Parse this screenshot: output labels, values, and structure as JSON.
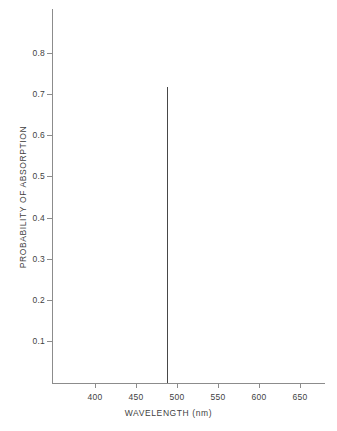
{
  "chart_data": {
    "type": "bar",
    "title": "",
    "subtitle": "",
    "xlabel": "WAVELENGTH (nm)",
    "ylabel": "PROBABILITY OF ABSORPTION",
    "xlim": [
      360,
      690
    ],
    "ylim": [
      0,
      0.93
    ],
    "grid": false,
    "legend": null,
    "x_ticks": [
      400,
      450,
      500,
      550,
      600,
      650
    ],
    "x_tick_labels": [
      "400",
      "450",
      "500",
      "550",
      "600",
      "650"
    ],
    "y_ticks": [
      0.1,
      0.2,
      0.3,
      0.4,
      0.5,
      0.6,
      0.7,
      0.8
    ],
    "y_tick_labels": [
      "0.1",
      "0.2",
      "0.3",
      "0.4",
      "0.5",
      "0.6",
      "0.7",
      "0.8"
    ],
    "series": [
      {
        "name": "absorption spike",
        "color": "#474747",
        "x": [
          488
        ],
        "values": [
          0.71
        ]
      }
    ],
    "annotations": []
  },
  "axes": {
    "axis_color": "#8c8c8c",
    "tick_color": "#8c8c8c",
    "label_color": "#3f3f3f",
    "background": "#ffffff"
  }
}
